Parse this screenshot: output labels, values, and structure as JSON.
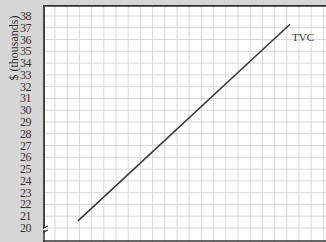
{
  "chart_data": {
    "type": "line",
    "title": "",
    "xlabel": "",
    "ylabel": "$ (thousands)",
    "ylim": [
      20,
      38
    ],
    "yticks": [
      20,
      21,
      22,
      23,
      24,
      25,
      26,
      27,
      28,
      29,
      30,
      31,
      32,
      33,
      34,
      35,
      36,
      37,
      38
    ],
    "ytick_labels": [
      "20",
      "21",
      "22",
      "23",
      "24",
      "25",
      "26",
      "27",
      "28",
      "29",
      "30",
      "31",
      "32",
      "33",
      "34",
      "35",
      "36",
      "37",
      "38"
    ],
    "axis_break": "y-axis broken below 20",
    "grid": true,
    "series": [
      {
        "name": "TVC",
        "label": "TVC",
        "x": [
          0,
          1
        ],
        "values": [
          20.6,
          37.3
        ],
        "color": "#3a3a3a"
      }
    ],
    "legend": "inline label at end of line"
  },
  "colors": {
    "background": "#d6d6d6",
    "plot_bg": "#ffffff",
    "grid": "#cfcfcf",
    "axis": "#333333",
    "line": "#3a3a3a"
  }
}
